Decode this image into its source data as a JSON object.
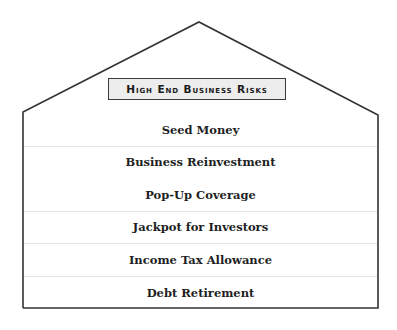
{
  "diagram": {
    "type": "house",
    "title": "High End Business Risks",
    "rows": [
      {
        "label": "Seed Money",
        "divider_below": true
      },
      {
        "label": "Business Reinvestment",
        "divider_below": false
      },
      {
        "label": "Pop-Up Coverage",
        "divider_below": true
      },
      {
        "label": "Jackpot for Investors",
        "divider_below": true
      },
      {
        "label": "Income Tax Allowance",
        "divider_below": true
      },
      {
        "label": "Debt Retirement",
        "divider_below": false
      }
    ],
    "colors": {
      "outline": "#333333",
      "title_fill": "#ededed",
      "divider": "#e4e4e4",
      "text": "#1f1f1f"
    }
  }
}
